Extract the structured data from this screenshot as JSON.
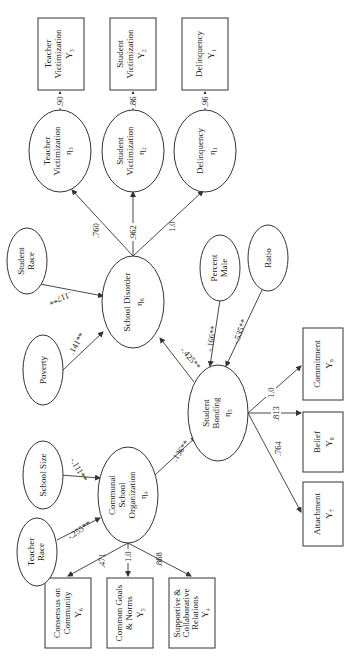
{
  "diagram": {
    "orientation": "rotated-90-ccw",
    "observed_indicators": {
      "y1": {
        "line1": "Delinquency",
        "line2": "",
        "sym": "Y₁"
      },
      "y2": {
        "line1": "Student",
        "line2": "Victimization",
        "sym": "Y₂"
      },
      "y3": {
        "line1": "Teacher",
        "line2": "Victimization",
        "sym": "Y₃"
      },
      "y4": {
        "line1": "Supportive &",
        "line2": "Collaborative",
        "line3": "Relations",
        "sym": "Y₄"
      },
      "y5": {
        "line1": "Common Goals",
        "line2": "& Norms",
        "sym": "Y₅"
      },
      "y6": {
        "line1": "Consensus on",
        "line2": "Community",
        "sym": "Y₆"
      },
      "y7": {
        "line1": "Attachment",
        "sym": "Y₇"
      },
      "y8": {
        "line1": "Belief",
        "sym": "Y₈"
      },
      "y9": {
        "line1": "Commitment",
        "sym": "Y₉"
      }
    },
    "latent_constructs": {
      "eta1": {
        "line1": "Delinquency",
        "line2": "",
        "sym": "η₁"
      },
      "eta2": {
        "line1": "Student",
        "line2": "Victimization",
        "sym": "η₂"
      },
      "eta3": {
        "line1": "Teacher",
        "line2": "Victimization",
        "sym": "η₃"
      },
      "eta4": {
        "line1": "Communal",
        "line2": "School",
        "line3": "Organization",
        "sym": "η₄"
      },
      "eta5": {
        "line1": "Student",
        "line2": "Bonding",
        "sym": "η₅"
      },
      "eta6": {
        "line1": "School Disorder",
        "sym": "η₆"
      }
    },
    "exogenous": {
      "teacher_race": {
        "line1": "Teacher",
        "line2": "Race"
      },
      "school_size": {
        "line1": "School Size"
      },
      "poverty": {
        "line1": "Poverty"
      },
      "student_race": {
        "line1": "Student",
        "line2": "Race"
      },
      "percent_male": {
        "line1": "Percent",
        "line2": "Male"
      },
      "ratio": {
        "line1": "Ratio"
      }
    },
    "paths": {
      "eta3_y3": ".90",
      "eta2_y2": ".86",
      "eta1_y1": ".96",
      "eta6_eta3": ".760",
      "eta6_eta2": ".962",
      "eta6_eta1": "1.0",
      "student_race_eta6": ".117**",
      "poverty_eta6": ".141**",
      "eta5_eta6": "-.425**",
      "percent_male_eta5": "-.166**",
      "ratio_eta5": "-.535**",
      "eta4_eta5": ".136**",
      "school_size_eta4": "-.111**",
      "teacher_race_eta4": "-.255**",
      "eta4_y6": ".471",
      "eta4_y5": "1.0",
      "eta4_y4": ".868",
      "eta5_y9": "1.0",
      "eta5_y8": ".813",
      "eta5_y7": ".764"
    }
  }
}
